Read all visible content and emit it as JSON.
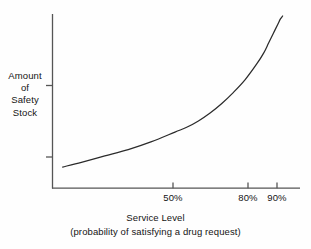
{
  "chart_data": {
    "type": "line",
    "title": "",
    "subtitle": "",
    "xlabel": "Service Level",
    "xlabel_sub": "(probability of satisfying a drug request)",
    "ylabel_lines": [
      "Amount",
      "of",
      "Safety",
      "Stock"
    ],
    "ylabel": "Amount of Safety Stock",
    "xlim": [
      0,
      100
    ],
    "ylim": [
      0,
      100
    ],
    "grid": false,
    "legend": "none",
    "xticks": [
      {
        "value": 50,
        "label": "50%"
      },
      {
        "value": 80,
        "label": "80%"
      },
      {
        "value": 90,
        "label": "90%"
      }
    ],
    "yticks": [
      {
        "value": 72,
        "label": ""
      },
      {
        "value": 18,
        "label": ""
      }
    ],
    "series": [
      {
        "name": "Safety stock vs service level",
        "x": [
          2,
          10,
          20,
          30,
          40,
          50,
          55,
          60,
          65,
          70,
          75,
          80,
          85,
          88,
          90,
          92,
          94,
          95,
          96
        ],
        "y": [
          5,
          8,
          12,
          16,
          21,
          27,
          30,
          34,
          39,
          45,
          52,
          60,
          70,
          77,
          83,
          89,
          95,
          98,
          100
        ]
      }
    ],
    "colors": {
      "curve": "#2b2b2b",
      "axis": "#555555",
      "background": "#fefefe",
      "text": "#141414"
    }
  },
  "axes": {
    "x_tick_50": "50%",
    "x_tick_80": "80%",
    "x_tick_90": "90%"
  },
  "labels": {
    "y_line_1": "Amount",
    "y_line_2": "of",
    "y_line_3": "Safety",
    "y_line_4": "Stock",
    "caption_main": "Service Level",
    "caption_sub": "(probability of satisfying a drug request)"
  }
}
